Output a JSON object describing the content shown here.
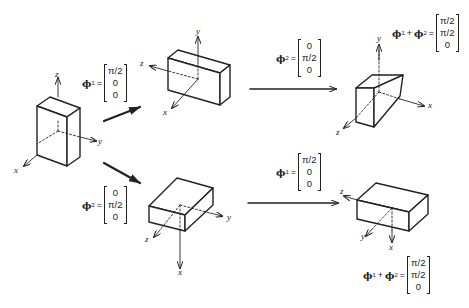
{
  "figure": {
    "axis_labels": {
      "x": "x",
      "y": "y",
      "z": "z"
    },
    "initial_box": {
      "axes": [
        "z",
        "y",
        "x"
      ]
    },
    "top_path": {
      "step1_label": {
        "symbol": "ϕ",
        "sub": "1",
        "eq": "=",
        "vector": [
          "π/2",
          "0",
          "0"
        ]
      },
      "mid_box_axes": [
        "y",
        "z",
        "x"
      ],
      "step2_label": {
        "symbol": "ϕ",
        "sub": "2",
        "eq": "=",
        "vector": [
          "0",
          "π/2",
          "0"
        ]
      },
      "final_box_axes": [
        "y",
        "x",
        "z"
      ],
      "result_label": {
        "symbol1": "ϕ",
        "sub1": "1",
        "plus": "+",
        "symbol2": "ϕ",
        "sub2": "2",
        "eq": "=",
        "vector": [
          "π/2",
          "π/2",
          "0"
        ]
      }
    },
    "bottom_path": {
      "step1_label": {
        "symbol": "ϕ",
        "sub": "2",
        "eq": "=",
        "vector": [
          "0",
          "π/2",
          "0"
        ]
      },
      "mid_box_axes": [
        "y",
        "z",
        "x"
      ],
      "step2_label": {
        "symbol": "ϕ",
        "sub": "1",
        "eq": "=",
        "vector": [
          "π/2",
          "0",
          "0"
        ]
      },
      "final_box_axes": [
        "z",
        "y",
        "x"
      ],
      "result_label": {
        "symbol1": "ϕ",
        "sub1": "1",
        "plus": "+",
        "symbol2": "ϕ",
        "sub2": "2",
        "eq": "=",
        "vector": [
          "π/2",
          "π/2",
          "0"
        ]
      }
    }
  }
}
